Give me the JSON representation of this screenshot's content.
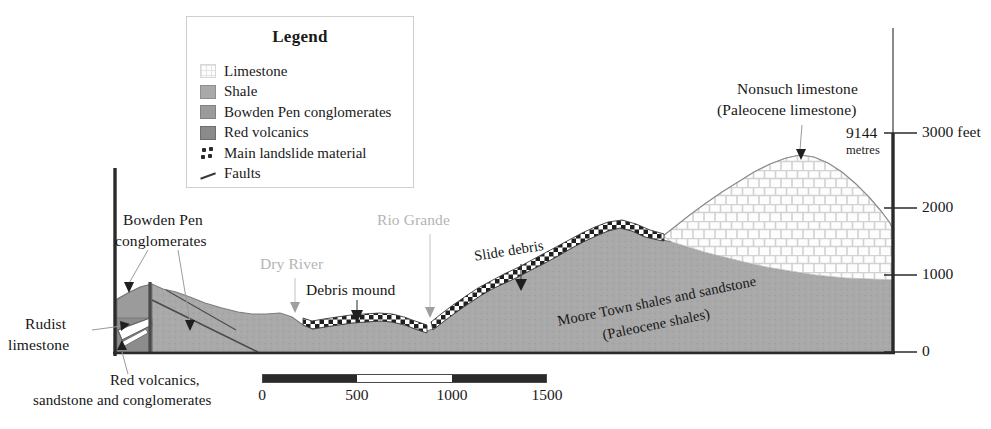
{
  "figure": {
    "type": "geological-cross-section",
    "title_present": false
  },
  "legend": {
    "title": "Legend",
    "items": [
      {
        "label": "Limestone",
        "swatch": "limestone-swatch",
        "color": "#fdfdfd"
      },
      {
        "label": "Shale",
        "swatch": "shale-swatch",
        "color": "#a9a9a9"
      },
      {
        "label": "Bowden Pen conglomerates",
        "swatch": "bowden-pen-swatch",
        "color": "#9b9b9b"
      },
      {
        "label": "Red volcanics",
        "swatch": "red-volcanics-swatch",
        "color": "#8a8a8a"
      },
      {
        "label": "Main landslide material",
        "swatch": "landslide-dots-swatch",
        "color": "#2b2b2b"
      },
      {
        "label": "Faults",
        "swatch": "fault-line-swatch",
        "color": "#3a3a3a"
      }
    ]
  },
  "annotations": {
    "nonsuch_line1": "Nonsuch limestone",
    "nonsuch_line2": "(Paleocene limestone)",
    "bowden_line1": "Bowden Pen",
    "bowden_line2": "conglomerates",
    "rudist_line1": "Rudist",
    "rudist_line2": "limestone",
    "red_volcanics_line1": "Red volcanics,",
    "red_volcanics_line2": "sandstone and conglomerates",
    "dry_river": "Dry River",
    "rio_grande": "Rio Grande",
    "debris_mound": "Debris mound",
    "slide_debris": "Slide debris",
    "moore_line1": "Moore Town shales and sandstone",
    "moore_line2": "(Paleocene shales)"
  },
  "vertical_axis": {
    "unit_primary": "feet",
    "unit_secondary": "metres",
    "metres_value": "9144",
    "metres_label": "metres",
    "ticks": [
      {
        "value": "3000",
        "display": "3000 feet",
        "y": 133
      },
      {
        "value": "2000",
        "display": "2000",
        "y": 208
      },
      {
        "value": "1000",
        "display": "1000",
        "y": 275
      },
      {
        "value": "0",
        "display": "0",
        "y": 352
      }
    ]
  },
  "scale_bar": {
    "unit_implied": "metres",
    "ticks": [
      "0",
      "500",
      "1000",
      "1500"
    ],
    "segments": [
      {
        "from": "0",
        "to": "500",
        "filled": true
      },
      {
        "from": "500",
        "to": "1000",
        "filled": false
      },
      {
        "from": "1000",
        "to": "1500",
        "filled": true
      }
    ]
  },
  "colors": {
    "shale_fill": "#a9a9a9",
    "bowden_fill": "#9b9b9b",
    "red_volcanics_fill": "#8a8a8a",
    "limestone_fill": "#fdfdfd",
    "limestone_pattern": "#d8d8d8",
    "landslide_dark": "#262626",
    "outline": "#6e6e6e",
    "axis": "#2a2a2a",
    "grey_text": "#b4b4b4"
  }
}
